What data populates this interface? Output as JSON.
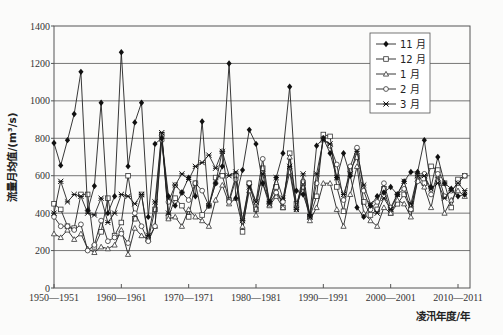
{
  "chart_data": {
    "type": "line",
    "title": "",
    "xlabel": "凌汛年度/年",
    "ylabel": "流量月均值/(m³/s)",
    "ylim": [
      0,
      1400
    ],
    "yticks": [
      0,
      200,
      400,
      600,
      800,
      1000,
      1200,
      1400
    ],
    "xtick_labels": [
      "1950—1951",
      "1960—1961",
      "1970—1971",
      "1980—1981",
      "1990—1991",
      "2000—2001",
      "2010—2011"
    ],
    "grid": "horizontal",
    "legend_position": "upper right",
    "x": [
      1950,
      1951,
      1952,
      1953,
      1954,
      1955,
      1956,
      1957,
      1958,
      1959,
      1960,
      1961,
      1962,
      1963,
      1964,
      1965,
      1966,
      1967,
      1968,
      1969,
      1970,
      1971,
      1972,
      1973,
      1974,
      1975,
      1976,
      1977,
      1978,
      1979,
      1980,
      1981,
      1982,
      1983,
      1984,
      1985,
      1986,
      1987,
      1988,
      1989,
      1990,
      1991,
      1992,
      1993,
      1994,
      1995,
      1996,
      1997,
      1998,
      1999,
      2000,
      2001,
      2002,
      2003,
      2004,
      2005,
      2006,
      2007,
      2008,
      2009,
      2010,
      2011
    ],
    "series": [
      {
        "name": "11 月",
        "marker": "filled-diamond",
        "values": [
          775,
          655,
          790,
          930,
          1155,
          415,
          545,
          990,
          400,
          490,
          1260,
          650,
          885,
          990,
          380,
          770,
          800,
          490,
          440,
          510,
          590,
          490,
          890,
          440,
          560,
          650,
          1200,
          480,
          630,
          845,
          770,
          560,
          460,
          590,
          720,
          1075,
          520,
          500,
          390,
          760,
          800,
          720,
          590,
          720,
          600,
          430,
          380,
          440,
          490,
          510,
          540,
          500,
          570,
          620,
          620,
          790,
          540,
          700,
          560,
          530,
          490,
          500
        ]
      },
      {
        "name": "12 月",
        "marker": "open-square",
        "values": [
          450,
          420,
          330,
          320,
          500,
          500,
          220,
          300,
          480,
          280,
          350,
          600,
          370,
          500,
          260,
          420,
          820,
          380,
          480,
          440,
          380,
          560,
          390,
          440,
          590,
          600,
          470,
          600,
          300,
          560,
          420,
          640,
          460,
          540,
          430,
          720,
          450,
          560,
          380,
          490,
          820,
          810,
          540,
          410,
          630,
          700,
          460,
          390,
          420,
          530,
          400,
          450,
          500,
          420,
          600,
          560,
          650,
          630,
          560,
          430,
          580,
          600
        ]
      },
      {
        "name": "1 月",
        "marker": "open-triangle",
        "values": [
          290,
          270,
          310,
          260,
          290,
          210,
          190,
          220,
          210,
          230,
          310,
          180,
          320,
          280,
          260,
          330,
          810,
          370,
          380,
          330,
          420,
          380,
          360,
          330,
          470,
          550,
          450,
          480,
          330,
          520,
          390,
          560,
          440,
          490,
          430,
          700,
          440,
          540,
          360,
          430,
          560,
          560,
          420,
          330,
          500,
          650,
          400,
          360,
          330,
          430,
          400,
          470,
          450,
          380,
          580,
          540,
          430,
          600,
          400,
          470,
          520,
          490
        ]
      },
      {
        "name": "2 月",
        "marker": "open-circle",
        "values": [
          380,
          330,
          330,
          310,
          340,
          200,
          230,
          360,
          250,
          270,
          290,
          240,
          400,
          330,
          250,
          330,
          790,
          460,
          550,
          510,
          470,
          560,
          520,
          440,
          560,
          730,
          460,
          580,
          360,
          560,
          460,
          690,
          450,
          510,
          460,
          620,
          420,
          570,
          390,
          560,
          800,
          760,
          660,
          470,
          650,
          750,
          520,
          420,
          460,
          560,
          430,
          500,
          530,
          420,
          570,
          610,
          500,
          610,
          490,
          520,
          560,
          600
        ]
      },
      {
        "name": "3 月",
        "marker": "asterisk",
        "values": [
          400,
          570,
          460,
          500,
          490,
          400,
          390,
          480,
          350,
          400,
          500,
          490,
          450,
          500,
          280,
          460,
          830,
          400,
          550,
          610,
          580,
          650,
          670,
          710,
          640,
          730,
          600,
          620,
          360,
          540,
          460,
          610,
          450,
          590,
          480,
          650,
          420,
          610,
          380,
          610,
          790,
          770,
          590,
          500,
          610,
          730,
          550,
          450,
          400,
          480,
          420,
          500,
          570,
          450,
          600,
          600,
          530,
          560,
          480,
          520,
          560,
          520
        ]
      }
    ]
  },
  "axis": {
    "ylabel": "流量月均值/(m³/s)",
    "xlabel": "凌汛年度/年",
    "yticks": [
      "0",
      "200",
      "400",
      "600",
      "800",
      "1000",
      "1200",
      "1400"
    ],
    "xticks": [
      "1950—1951",
      "1960—1961",
      "1970—1971",
      "1980—1981",
      "1990—1991",
      "2000—2001",
      "2010—2011"
    ]
  },
  "legend": [
    "11 月",
    "12 月",
    "1 月",
    "2 月",
    "3 月"
  ]
}
